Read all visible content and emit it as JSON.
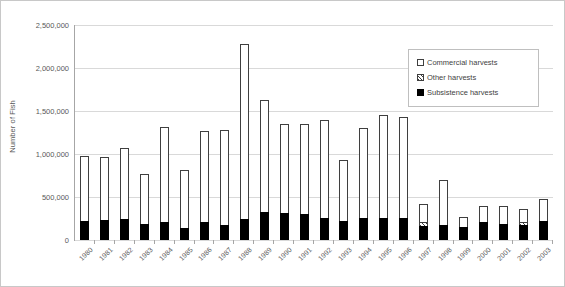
{
  "chart_data": {
    "type": "bar",
    "stacked": true,
    "title": "",
    "xlabel": "",
    "ylabel": "Number of Fish",
    "ylim": [
      0,
      2500000
    ],
    "ytick_values": [
      0,
      500000,
      1000000,
      1500000,
      2000000,
      2500000
    ],
    "ytick_labels": [
      "0",
      "500,000",
      "1,000,000",
      "1,500,000",
      "2,000,000",
      "2,500,000"
    ],
    "grid": true,
    "legend_position": "upper right",
    "categories": [
      "1980",
      "1981",
      "1982",
      "1983",
      "1984",
      "1985",
      "1986",
      "1987",
      "1988",
      "1989",
      "1990",
      "1991",
      "1992",
      "1993",
      "1994",
      "1995",
      "1996",
      "1997",
      "1998",
      "1999",
      "2000",
      "2001",
      "2002",
      "2003"
    ],
    "series": [
      {
        "name": "Subsistence harvests",
        "fill": "solid-black",
        "color": "#000000",
        "values": [
          225000,
          230000,
          250000,
          185000,
          205000,
          145000,
          215000,
          180000,
          240000,
          330000,
          310000,
          300000,
          255000,
          220000,
          255000,
          260000,
          255000,
          165000,
          175000,
          155000,
          205000,
          185000,
          180000,
          225000
        ]
      },
      {
        "name": "Other harvests",
        "fill": "hatched",
        "color": "#3f3f3f",
        "values": [
          0,
          0,
          0,
          0,
          0,
          0,
          0,
          0,
          0,
          0,
          0,
          0,
          0,
          0,
          0,
          0,
          0,
          40000,
          0,
          0,
          0,
          0,
          35000,
          0
        ]
      },
      {
        "name": "Commercial harvests",
        "fill": "white",
        "color": "#ffffff",
        "values": [
          750000,
          730000,
          815000,
          580000,
          1110000,
          665000,
          1055000,
          1100000,
          2040000,
          1300000,
          1035000,
          1050000,
          1140000,
          715000,
          1050000,
          1190000,
          1170000,
          210000,
          525000,
          110000,
          185000,
          205000,
          150000,
          250000
        ]
      }
    ],
    "totals": [
      975000,
      960000,
      1065000,
      765000,
      1315000,
      810000,
      1270000,
      1280000,
      2280000,
      1630000,
      1345000,
      1350000,
      1395000,
      935000,
      1305000,
      1450000,
      1425000,
      415000,
      700000,
      265000,
      390000,
      390000,
      365000,
      475000
    ]
  },
  "legend": {
    "items": [
      {
        "label": "Commercial harvests",
        "swatch": "commercial-swatch-icon"
      },
      {
        "label": "Other harvests",
        "swatch": "other-swatch-icon"
      },
      {
        "label": "Subsistence harvests",
        "swatch": "subsistence-swatch-icon"
      }
    ]
  },
  "axis": {
    "y_title": "Number of Fish"
  },
  "colors": {
    "gridline": "#d9d9d9",
    "axis": "#a6a6a6",
    "tick_text": "#595959",
    "bar_outline": "#3f3f3f",
    "subsistence": "#000000",
    "commercial": "#ffffff",
    "background": "#ffffff"
  }
}
